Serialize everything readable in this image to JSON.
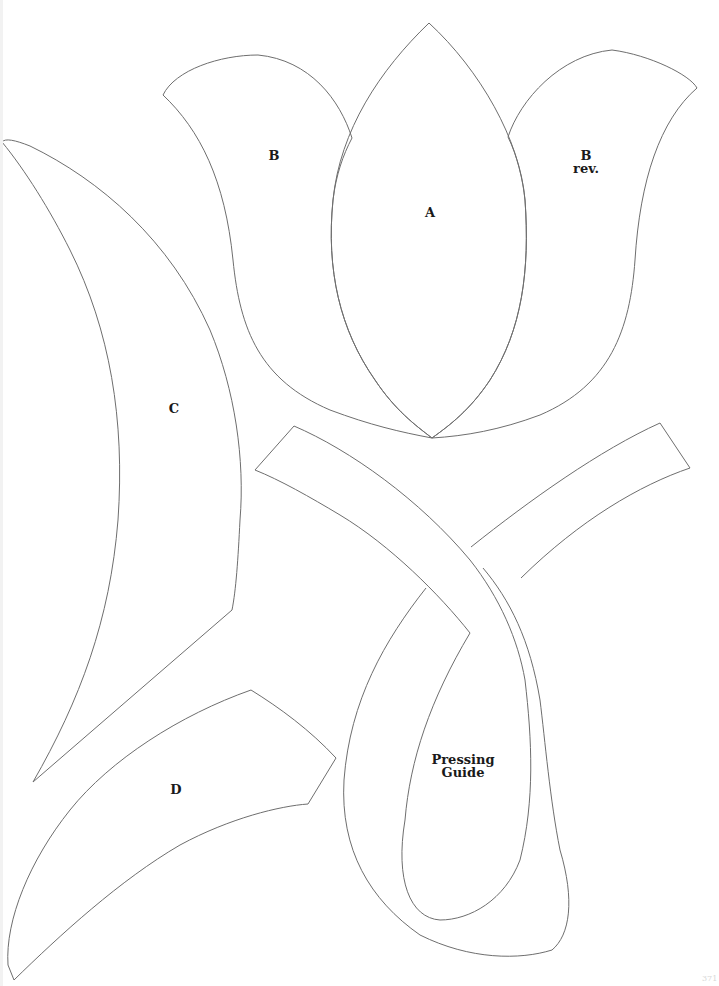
{
  "page": {
    "background": "#ffffff",
    "line_color": "#6e6e6e",
    "text_color": "#1a1a1a"
  },
  "pieces": {
    "a": {
      "label": "A"
    },
    "b": {
      "label": "B"
    },
    "b_rev": {
      "label_line1": "B",
      "label_line2": "rev."
    },
    "c": {
      "label": "C"
    },
    "d": {
      "label": "D"
    },
    "pressing_guide": {
      "label_line1": "Pressing",
      "label_line2": "Guide"
    }
  },
  "footer": {
    "page_mark": "371"
  }
}
